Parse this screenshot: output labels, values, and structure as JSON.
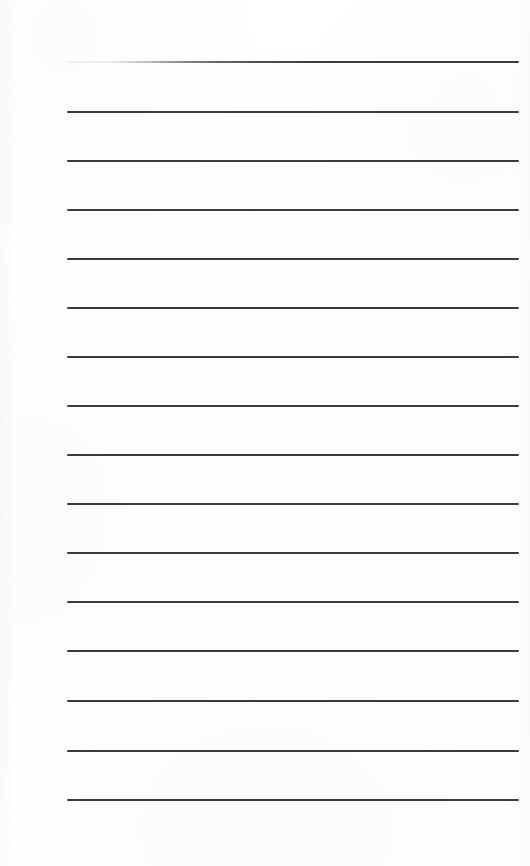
{
  "page": {
    "kind": "scanned-ruled-notepad-page",
    "width": 530,
    "height": 866,
    "background_color": "#fefefe",
    "text_content": "",
    "handwriting_present": "false"
  },
  "ruling": {
    "line_color": "#3a3a40",
    "line_thickness_px": 2,
    "line_count": 16,
    "left_x": 67,
    "right_x": 519,
    "line_width_px": 452,
    "spacing_px": 49.2,
    "first_line_y": 61,
    "last_line_y": 799,
    "first_line_fades_at_left": "true",
    "lines_y": [
      61,
      111,
      160,
      209,
      258,
      307,
      356,
      405,
      454,
      503,
      552,
      601,
      650,
      700,
      750,
      799
    ]
  }
}
